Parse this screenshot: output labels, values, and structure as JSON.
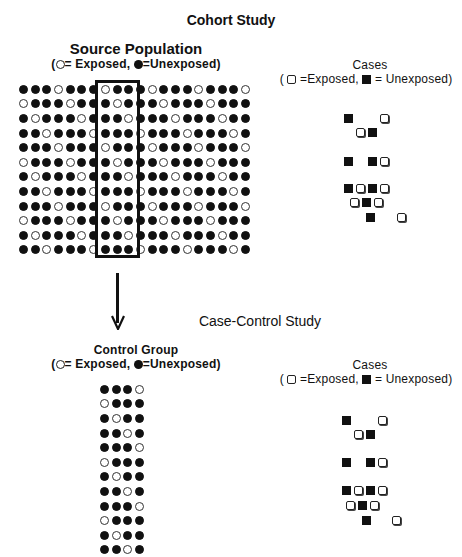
{
  "cohort": {
    "title": "Cohort Study",
    "population_title": "Source Population",
    "population_legend": {
      "open_paren": "(",
      "exposed_label": "= Exposed,",
      "unexposed_label": "=Unexposed)"
    },
    "cases_title": "Cases",
    "cases_legend": {
      "open_paren": "(",
      "exposed_label": "=Exposed,",
      "unexposed_label": "= Unexposed)"
    },
    "grid": {
      "rows": 12,
      "cols": 20,
      "row_patterns": [
        "fffo",
        "offf",
        "foff",
        "ffof"
      ],
      "legend_open": "exposed",
      "legend_filled": "unexposed"
    },
    "cases": [
      {
        "x": 344,
        "y": 114,
        "type": "f"
      },
      {
        "x": 380,
        "y": 114,
        "type": "o"
      },
      {
        "x": 356,
        "y": 128,
        "type": "o"
      },
      {
        "x": 368,
        "y": 128,
        "type": "f"
      },
      {
        "x": 344,
        "y": 157,
        "type": "f"
      },
      {
        "x": 368,
        "y": 157,
        "type": "f"
      },
      {
        "x": 380,
        "y": 157,
        "type": "o"
      },
      {
        "x": 344,
        "y": 184,
        "type": "f"
      },
      {
        "x": 356,
        "y": 184,
        "type": "o"
      },
      {
        "x": 368,
        "y": 184,
        "type": "f"
      },
      {
        "x": 380,
        "y": 184,
        "type": "o"
      },
      {
        "x": 350,
        "y": 198,
        "type": "o"
      },
      {
        "x": 362,
        "y": 198,
        "type": "f"
      },
      {
        "x": 374,
        "y": 198,
        "type": "o"
      },
      {
        "x": 366,
        "y": 213,
        "type": "f"
      },
      {
        "x": 397,
        "y": 213,
        "type": "o"
      }
    ]
  },
  "case_control": {
    "title": "Case-Control Study",
    "control_title": "Control Group",
    "control_legend": {
      "open_paren": "(",
      "exposed_label": "= Exposed,",
      "unexposed_label": "=Unexposed)"
    },
    "cases_title": "Cases",
    "cases_legend": {
      "open_paren": "(",
      "exposed_label": "=Exposed,",
      "unexposed_label": "= Unexposed)"
    },
    "grid": {
      "rows": 12,
      "cols": 4,
      "row_patterns": [
        "fffo",
        "offf",
        "foff",
        "ffof"
      ]
    },
    "cases": [
      {
        "x": 342,
        "y": 416,
        "type": "f"
      },
      {
        "x": 378,
        "y": 416,
        "type": "o"
      },
      {
        "x": 354,
        "y": 430,
        "type": "o"
      },
      {
        "x": 366,
        "y": 430,
        "type": "f"
      },
      {
        "x": 342,
        "y": 458,
        "type": "f"
      },
      {
        "x": 366,
        "y": 458,
        "type": "f"
      },
      {
        "x": 378,
        "y": 458,
        "type": "o"
      },
      {
        "x": 342,
        "y": 486,
        "type": "f"
      },
      {
        "x": 354,
        "y": 486,
        "type": "o"
      },
      {
        "x": 366,
        "y": 486,
        "type": "f"
      },
      {
        "x": 378,
        "y": 486,
        "type": "o"
      },
      {
        "x": 346,
        "y": 501,
        "type": "o"
      },
      {
        "x": 358,
        "y": 501,
        "type": "f"
      },
      {
        "x": 370,
        "y": 501,
        "type": "o"
      },
      {
        "x": 362,
        "y": 516,
        "type": "f"
      },
      {
        "x": 392,
        "y": 516,
        "type": "o"
      }
    ]
  },
  "selection_box": {
    "label": "sampled-controls-column"
  }
}
